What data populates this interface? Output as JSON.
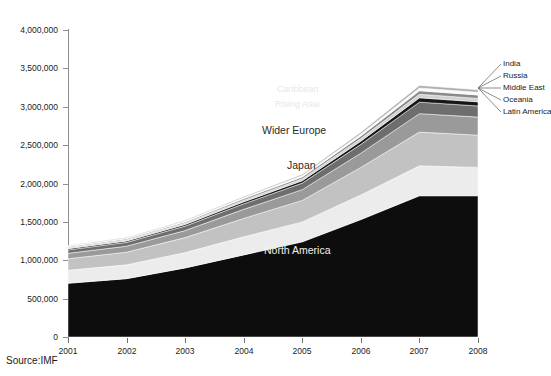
{
  "figure": {
    "clipped_title": "",
    "source_note": "Source:IMF"
  },
  "axis": {
    "y_ticks": [
      "4,000,000",
      "3,500,000",
      "3,000,000",
      "2,500,000",
      "2,000,000",
      "1,500,000",
      "1,000,000",
      "500,000",
      "0"
    ],
    "x_ticks": [
      "2001",
      "2002",
      "2003",
      "2004",
      "2005",
      "2006",
      "2007",
      "2008"
    ]
  },
  "inchart_labels": {
    "north_america": "North America",
    "japan": "Japan",
    "wider_europe": "Wider Europe",
    "rising_asia": "Rising Asia",
    "caribbean": "Caribbean"
  },
  "callouts": [
    {
      "label": "India"
    },
    {
      "label": "Russia"
    },
    {
      "label": "Middle East"
    },
    {
      "label": "Oceania"
    },
    {
      "label": "Latin America"
    }
  ],
  "colors": {
    "north_america": "#0d0d0d",
    "japan": "#ececec",
    "wider_europe": "#c2c2c2",
    "rising_asia": "#9a9a9a",
    "caribbean": "#6e6e6e",
    "latin_america": "#171717",
    "oceania": "#d2d2d2",
    "middle_east": "#8a8a8a",
    "russia": "#fbfbfb",
    "india": "#b0b0b0",
    "axis": "#8d8d8d",
    "background": "#ffffff"
  },
  "chart_data": {
    "type": "area",
    "title": "",
    "subtitle": "",
    "xlabel": "",
    "ylabel": "",
    "stacked": true,
    "grid": false,
    "legend": "in-chart labels and right-side callouts",
    "ylim": [
      0,
      4000000
    ],
    "ytick_step": 500000,
    "x": [
      2001,
      2002,
      2003,
      2004,
      2005,
      2006,
      2007,
      2008
    ],
    "series": [
      {
        "name": "North America",
        "values": [
          700000,
          760000,
          900000,
          1070000,
          1240000,
          1530000,
          1840000,
          1840000
        ]
      },
      {
        "name": "Japan",
        "values": [
          170000,
          180000,
          200000,
          235000,
          260000,
          320000,
          390000,
          370000
        ]
      },
      {
        "name": "Wider Europe",
        "values": [
          150000,
          165000,
          195000,
          240000,
          280000,
          360000,
          440000,
          420000
        ]
      },
      {
        "name": "Rising Asia",
        "values": [
          70000,
          78000,
          92000,
          118000,
          140000,
          185000,
          240000,
          235000
        ]
      },
      {
        "name": "Caribbean",
        "values": [
          45000,
          50000,
          58000,
          72000,
          85000,
          115000,
          150000,
          145000
        ]
      },
      {
        "name": "Latin America",
        "values": [
          16000,
          18000,
          21000,
          26000,
          31000,
          42000,
          56000,
          54000
        ]
      },
      {
        "name": "Oceania",
        "values": [
          14000,
          15000,
          18000,
          22000,
          26000,
          35000,
          47000,
          45000
        ]
      },
      {
        "name": "Middle East",
        "values": [
          12000,
          13000,
          16000,
          20000,
          24000,
          33000,
          45000,
          44000
        ]
      },
      {
        "name": "Russia",
        "values": [
          8000,
          9000,
          11000,
          14000,
          17000,
          25000,
          36000,
          35000
        ]
      },
      {
        "name": "India",
        "values": [
          7000,
          8000,
          10000,
          13000,
          16000,
          24000,
          34000,
          33000
        ]
      }
    ],
    "totals": [
      1192000,
      1296000,
      1521000,
      1830000,
      2119000,
      2669000,
      3278000,
      3221000
    ]
  }
}
